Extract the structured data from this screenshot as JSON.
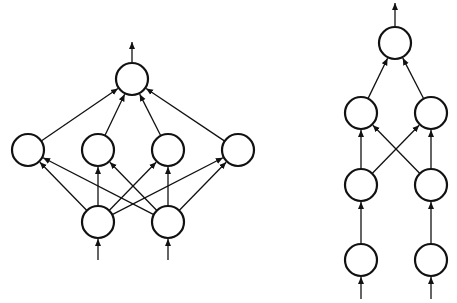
{
  "diagram": {
    "background": "#ffffff",
    "stroke_color": "#111111",
    "node_radius": 16,
    "networks": [
      {
        "name": "wide-network",
        "description": "Shallow wide network: 2 inputs, 4 hidden units, 1 output",
        "nodes": [
          {
            "id": "L_in1",
            "layer": "input",
            "x": 98,
            "y": 222
          },
          {
            "id": "L_in2",
            "layer": "input",
            "x": 168,
            "y": 222
          },
          {
            "id": "L_h1",
            "layer": "hidden",
            "x": 28,
            "y": 150
          },
          {
            "id": "L_h2",
            "layer": "hidden",
            "x": 98,
            "y": 150
          },
          {
            "id": "L_h3",
            "layer": "hidden",
            "x": 168,
            "y": 150
          },
          {
            "id": "L_h4",
            "layer": "hidden",
            "x": 238,
            "y": 150
          },
          {
            "id": "L_out",
            "layer": "output",
            "x": 132,
            "y": 79
          }
        ],
        "edges": [
          [
            "L_in1",
            "L_h1"
          ],
          [
            "L_in1",
            "L_h2"
          ],
          [
            "L_in1",
            "L_h3"
          ],
          [
            "L_in1",
            "L_h4"
          ],
          [
            "L_in2",
            "L_h1"
          ],
          [
            "L_in2",
            "L_h2"
          ],
          [
            "L_in2",
            "L_h3"
          ],
          [
            "L_in2",
            "L_h4"
          ],
          [
            "L_h1",
            "L_out"
          ],
          [
            "L_h2",
            "L_out"
          ],
          [
            "L_h3",
            "L_out"
          ],
          [
            "L_h4",
            "L_out"
          ]
        ],
        "input_arrows": [
          {
            "x": 98,
            "y1": 260,
            "y2": 239
          },
          {
            "x": 168,
            "y1": 260,
            "y2": 239
          }
        ],
        "output_arrow": {
          "x": 132,
          "y1": 62,
          "y2": 42
        }
      },
      {
        "name": "deep-network",
        "description": "Narrow deep network: 2 inputs, two hidden layers of 2 units, 1 output",
        "nodes": [
          {
            "id": "R_in1",
            "layer": "input",
            "x": 361,
            "y": 260
          },
          {
            "id": "R_in2",
            "layer": "input",
            "x": 431,
            "y": 260
          },
          {
            "id": "R_a1",
            "layer": "hidden1",
            "x": 361,
            "y": 185
          },
          {
            "id": "R_a2",
            "layer": "hidden1",
            "x": 431,
            "y": 185
          },
          {
            "id": "R_b1",
            "layer": "hidden2",
            "x": 361,
            "y": 113
          },
          {
            "id": "R_b2",
            "layer": "hidden2",
            "x": 431,
            "y": 113
          },
          {
            "id": "R_out",
            "layer": "output",
            "x": 395,
            "y": 43
          }
        ],
        "edges": [
          [
            "R_in1",
            "R_a1"
          ],
          [
            "R_in2",
            "R_a2"
          ],
          [
            "R_a1",
            "R_b1"
          ],
          [
            "R_a1",
            "R_b2"
          ],
          [
            "R_a2",
            "R_b1"
          ],
          [
            "R_a2",
            "R_b2"
          ],
          [
            "R_b1",
            "R_out"
          ],
          [
            "R_b2",
            "R_out"
          ]
        ],
        "input_arrows": [
          {
            "x": 361,
            "y1": 299,
            "y2": 277
          },
          {
            "x": 431,
            "y1": 299,
            "y2": 277
          }
        ],
        "output_arrow": {
          "x": 395,
          "y1": 26,
          "y2": 3
        }
      }
    ]
  }
}
